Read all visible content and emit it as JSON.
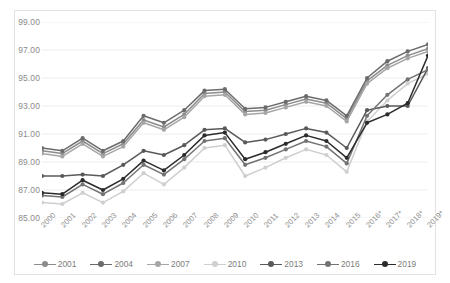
{
  "chart_data": {
    "type": "line",
    "title": "",
    "subtitle": "",
    "xlabel": "",
    "ylabel": "",
    "ylim": [
      85.0,
      99.0
    ],
    "ytick_step": 2.0,
    "ytick_labels": [
      "99.00",
      "97.00",
      "95.00",
      "93.00",
      "91.00",
      "89.00",
      "87.00",
      "85.00"
    ],
    "ytick_values": [
      99.0,
      97.0,
      95.0,
      93.0,
      91.0,
      89.0,
      87.0,
      85.0
    ],
    "grid": true,
    "grid_axis": "y",
    "legend_position": "bottom",
    "marker": "circle",
    "categories": [
      "2000",
      "2001",
      "2002",
      "2003",
      "2004",
      "2005",
      "2006",
      "2007",
      "2008",
      "2009",
      "2010",
      "2011",
      "2012",
      "2013",
      "2014",
      "2015",
      "2016*",
      "2017*",
      "2018*",
      "2019*"
    ],
    "series": [
      {
        "name": "2001",
        "color": "#8c8c8c",
        "values": [
          89.8,
          89.6,
          90.5,
          89.6,
          90.3,
          92.0,
          91.5,
          92.4,
          93.9,
          94.0,
          92.6,
          92.7,
          93.1,
          93.5,
          93.2,
          92.1,
          94.8,
          95.9,
          96.6,
          97.1
        ]
      },
      {
        "name": "2004",
        "color": "#6b6b6b",
        "values": [
          90.0,
          89.8,
          90.7,
          89.8,
          90.5,
          92.3,
          91.8,
          92.7,
          94.1,
          94.2,
          92.8,
          92.9,
          93.3,
          93.7,
          93.4,
          92.3,
          95.0,
          96.2,
          96.9,
          97.4
        ]
      },
      {
        "name": "2007",
        "color": "#a6a6a6",
        "values": [
          89.6,
          89.4,
          90.3,
          89.4,
          90.1,
          91.8,
          91.3,
          92.2,
          93.7,
          93.8,
          92.4,
          92.5,
          92.9,
          93.3,
          93.0,
          91.9,
          94.6,
          95.7,
          96.4,
          96.9
        ]
      },
      {
        "name": "2010",
        "color": "#cfcfcf",
        "values": [
          86.1,
          86.0,
          86.8,
          86.1,
          86.9,
          88.2,
          87.4,
          88.6,
          90.0,
          90.2,
          88.0,
          88.6,
          89.3,
          89.9,
          89.5,
          88.3,
          91.9,
          93.4,
          94.6,
          95.3
        ]
      },
      {
        "name": "2013",
        "color": "#595959",
        "values": [
          88.0,
          88.0,
          88.1,
          88.0,
          88.8,
          89.8,
          89.5,
          90.2,
          91.3,
          91.4,
          90.4,
          90.6,
          91.0,
          91.4,
          91.1,
          90.0,
          92.7,
          93.0,
          93.0,
          95.7
        ]
      },
      {
        "name": "2016",
        "color": "#737373",
        "values": [
          86.6,
          86.5,
          87.4,
          86.7,
          87.5,
          88.8,
          88.1,
          89.2,
          90.5,
          90.7,
          88.8,
          89.3,
          89.9,
          90.5,
          90.1,
          88.9,
          92.3,
          93.8,
          94.9,
          95.6
        ]
      },
      {
        "name": "2019",
        "color": "#2b2b2b",
        "values": [
          86.8,
          86.7,
          87.7,
          87.0,
          87.8,
          89.1,
          88.4,
          89.5,
          90.9,
          91.1,
          89.2,
          89.7,
          90.3,
          90.9,
          90.5,
          89.3,
          91.8,
          92.4,
          93.2,
          96.6
        ]
      }
    ]
  },
  "legend": {
    "items": [
      {
        "label": "2001"
      },
      {
        "label": "2004"
      },
      {
        "label": "2007"
      },
      {
        "label": "2010"
      },
      {
        "label": "2013"
      },
      {
        "label": "2016"
      },
      {
        "label": "2019"
      }
    ]
  },
  "style": {
    "grid_color": "#ededed",
    "frame_color": "#e2e2e2",
    "tick_text_color": "#8c8c8c",
    "background": "#ffffff"
  }
}
